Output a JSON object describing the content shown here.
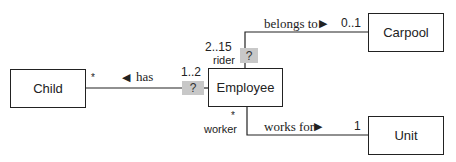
{
  "classes": {
    "child": {
      "name": "Child"
    },
    "employee": {
      "name": "Employee"
    },
    "carpool": {
      "name": "Carpool"
    },
    "unit": {
      "name": "Unit"
    }
  },
  "associations": {
    "has": {
      "name": "has",
      "direction_arrow": "◀",
      "child_end_multiplicity": "*",
      "employee_end_multiplicity": "1..2",
      "qualifier": "?"
    },
    "belongs_to": {
      "name": "belongs to",
      "direction_arrow": "▶",
      "employee_end_multiplicity": "2..15",
      "employee_end_role": "rider",
      "carpool_end_multiplicity": "0..1",
      "qualifier": "?"
    },
    "works_for": {
      "name": "works for",
      "direction_arrow": "▶",
      "employee_end_multiplicity": "*",
      "employee_end_role": "worker",
      "unit_end_multiplicity": "1"
    }
  },
  "colors": {
    "line": "#222222",
    "qualifier_fill": "#c8c8c8"
  }
}
